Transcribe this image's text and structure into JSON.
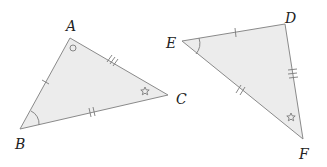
{
  "diagram": {
    "type": "congruent-triangles",
    "colors": {
      "fill": "#ececec",
      "stroke": "#8a8a8a",
      "mark": "#7a7a7a",
      "label": "#222222"
    },
    "triangles": [
      {
        "name": "ABC",
        "vertices": [
          {
            "label": "A",
            "x": 70,
            "y": 38,
            "label_x": 66,
            "label_y": 31,
            "angle_mark": "circle"
          },
          {
            "label": "B",
            "x": 20,
            "y": 129,
            "label_x": 16,
            "label_y": 148,
            "angle_mark": "arc"
          },
          {
            "label": "C",
            "x": 168,
            "y": 95,
            "label_x": 176,
            "label_y": 104,
            "angle_mark": "star"
          }
        ],
        "sides": [
          {
            "from": "A",
            "to": "B",
            "ticks": 1
          },
          {
            "from": "B",
            "to": "C",
            "ticks": 2
          },
          {
            "from": "A",
            "to": "C",
            "ticks": 3
          }
        ]
      },
      {
        "name": "DEF",
        "vertices": [
          {
            "label": "E",
            "x": 182,
            "y": 41,
            "label_x": 166,
            "label_y": 48,
            "angle_mark": "arc"
          },
          {
            "label": "D",
            "x": 285,
            "y": 24,
            "label_x": 285,
            "label_y": 23,
            "angle_mark": "none"
          },
          {
            "label": "F",
            "x": 303,
            "y": 139,
            "label_x": 299,
            "label_y": 159,
            "angle_mark": "star"
          }
        ],
        "sides": [
          {
            "from": "E",
            "to": "D",
            "ticks": 1
          },
          {
            "from": "E",
            "to": "F",
            "ticks": 2
          },
          {
            "from": "D",
            "to": "F",
            "ticks": 3
          }
        ]
      }
    ],
    "labels": {
      "A": "A",
      "B": "B",
      "C": "C",
      "D": "D",
      "E": "E",
      "F": "F"
    }
  }
}
